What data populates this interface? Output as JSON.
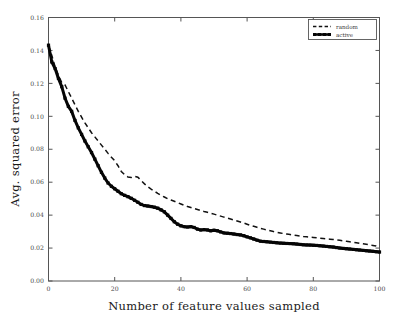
{
  "figure": {
    "background_color": "#ffffff",
    "frame_color": "#555555",
    "width": 398,
    "height": 323
  },
  "axes": {
    "x_label": "Number of feature values sampled",
    "y_label": "Avg. squared error",
    "x_ticks": [
      "0",
      "20",
      "40",
      "60",
      "80",
      "100"
    ],
    "y_ticks": [
      "0.00",
      "0.02",
      "0.04",
      "0.06",
      "0.08",
      "0.10",
      "0.12",
      "0.14",
      "0.16"
    ]
  },
  "legend": {
    "position": "top-right",
    "entries": [
      {
        "label": "random",
        "style": "dashed",
        "color": "#111111"
      },
      {
        "label": "active",
        "style": "solid-marker",
        "color": "#050505"
      }
    ]
  },
  "chart_data": {
    "type": "line",
    "title": "",
    "xlabel": "Number of feature values sampled",
    "ylabel": "Avg. squared error",
    "xlim": [
      0,
      100
    ],
    "ylim": [
      0.0,
      0.16
    ],
    "xticks": [
      0,
      20,
      40,
      60,
      80,
      100
    ],
    "yticks": [
      0.0,
      0.02,
      0.04,
      0.06,
      0.08,
      0.1,
      0.12,
      0.14,
      0.16
    ],
    "grid": false,
    "legend_position": "upper right",
    "x": [
      0,
      1,
      2,
      3,
      4,
      5,
      6,
      7,
      8,
      9,
      10,
      11,
      12,
      13,
      14,
      15,
      16,
      17,
      18,
      19,
      20,
      21,
      22,
      23,
      24,
      25,
      26,
      27,
      28,
      29,
      30,
      31,
      32,
      33,
      34,
      35,
      36,
      37,
      38,
      39,
      40,
      41,
      42,
      43,
      44,
      45,
      46,
      47,
      48,
      49,
      50,
      51,
      52,
      53,
      54,
      55,
      56,
      57,
      58,
      59,
      60,
      61,
      62,
      63,
      64,
      65,
      66,
      67,
      68,
      69,
      70,
      71,
      72,
      73,
      74,
      75,
      76,
      77,
      78,
      79,
      80,
      81,
      82,
      83,
      84,
      85,
      86,
      87,
      88,
      89,
      90,
      91,
      92,
      93,
      94,
      95,
      96,
      97,
      98,
      99,
      100
    ],
    "series": [
      {
        "name": "random",
        "style": "dashed",
        "color": "#111111",
        "values": [
          0.143,
          0.137,
          0.13,
          0.125,
          0.1205,
          0.119,
          0.115,
          0.111,
          0.107,
          0.103,
          0.0995,
          0.096,
          0.093,
          0.09,
          0.0875,
          0.085,
          0.0825,
          0.08,
          0.0775,
          0.0752,
          0.073,
          0.07,
          0.0665,
          0.0645,
          0.0632,
          0.0628,
          0.0635,
          0.063,
          0.061,
          0.059,
          0.0572,
          0.0558,
          0.0545,
          0.0532,
          0.052,
          0.051,
          0.05,
          0.0492,
          0.0484,
          0.0476,
          0.0468,
          0.046,
          0.0452,
          0.0446,
          0.044,
          0.0434,
          0.0428,
          0.0422,
          0.0417,
          0.0412,
          0.0406,
          0.04,
          0.0394,
          0.0388,
          0.0382,
          0.0376,
          0.037,
          0.0364,
          0.0358,
          0.0352,
          0.0345,
          0.0338,
          0.0332,
          0.0326,
          0.032,
          0.0315,
          0.031,
          0.0305,
          0.03,
          0.0296,
          0.0292,
          0.0288,
          0.0285,
          0.0282,
          0.0279,
          0.0276,
          0.0273,
          0.027,
          0.0268,
          0.0266,
          0.0264,
          0.0262,
          0.026,
          0.0258,
          0.0256,
          0.0254,
          0.0252,
          0.025,
          0.0247,
          0.0244,
          0.0241,
          0.0238,
          0.0235,
          0.0232,
          0.0229,
          0.0226,
          0.0223,
          0.022,
          0.0216,
          0.0212,
          0.0205
        ]
      },
      {
        "name": "active",
        "style": "solid-marker",
        "color": "#050505",
        "values": [
          0.1432,
          0.133,
          0.129,
          0.123,
          0.118,
          0.111,
          0.106,
          0.103,
          0.0975,
          0.093,
          0.089,
          0.085,
          0.0815,
          0.078,
          0.074,
          0.07,
          0.066,
          0.0625,
          0.0595,
          0.0575,
          0.056,
          0.0545,
          0.053,
          0.052,
          0.0512,
          0.0502,
          0.049,
          0.0478,
          0.0465,
          0.0458,
          0.0455,
          0.0452,
          0.0448,
          0.0442,
          0.0432,
          0.042,
          0.04,
          0.038,
          0.036,
          0.0345,
          0.0335,
          0.033,
          0.0328,
          0.033,
          0.0325,
          0.0315,
          0.031,
          0.0312,
          0.031,
          0.0305,
          0.0308,
          0.0305,
          0.0298,
          0.0292,
          0.029,
          0.0288,
          0.0285,
          0.0282,
          0.028,
          0.0275,
          0.0268,
          0.0262,
          0.0255,
          0.0248,
          0.0242,
          0.024,
          0.0238,
          0.0236,
          0.0234,
          0.0232,
          0.023,
          0.0229,
          0.0228,
          0.0227,
          0.0226,
          0.0224,
          0.0222,
          0.022,
          0.0219,
          0.0218,
          0.0217,
          0.0216,
          0.0214,
          0.0212,
          0.021,
          0.0208,
          0.0206,
          0.0203,
          0.02,
          0.0198,
          0.0196,
          0.0194,
          0.0192,
          0.019,
          0.0188,
          0.0186,
          0.0184,
          0.0182,
          0.018,
          0.0178,
          0.0176
        ]
      }
    ]
  }
}
